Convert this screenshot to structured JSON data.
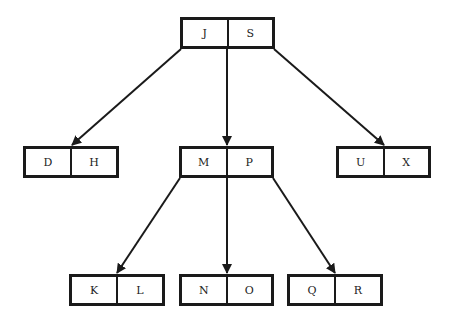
{
  "diagram": {
    "type": "B-tree",
    "colors": {
      "stroke": "#1a1a1a",
      "text": "#222222",
      "background": "#ffffff"
    },
    "nodes": {
      "root": {
        "keys": [
          "J",
          "S"
        ]
      },
      "left": {
        "keys": [
          "D",
          "H"
        ]
      },
      "middle": {
        "keys": [
          "M",
          "P"
        ]
      },
      "right": {
        "keys": [
          "U",
          "X"
        ]
      },
      "middle_left": {
        "keys": [
          "K",
          "L"
        ]
      },
      "middle_middle": {
        "keys": [
          "N",
          "O"
        ]
      },
      "middle_right": {
        "keys": [
          "Q",
          "R"
        ]
      }
    },
    "edges": [
      {
        "from": "root",
        "to": "left"
      },
      {
        "from": "root",
        "to": "middle"
      },
      {
        "from": "root",
        "to": "right"
      },
      {
        "from": "middle",
        "to": "middle_left"
      },
      {
        "from": "middle",
        "to": "middle_middle"
      },
      {
        "from": "middle",
        "to": "middle_right"
      }
    ]
  }
}
